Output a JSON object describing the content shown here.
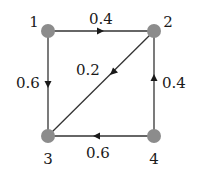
{
  "diagram": {
    "type": "directed-graph",
    "node_color": "#8c8c8c",
    "edge_color": "#333333",
    "nodes": [
      {
        "id": "1",
        "label": "1",
        "x": 48,
        "y": 31
      },
      {
        "id": "2",
        "label": "2",
        "x": 154,
        "y": 31
      },
      {
        "id": "3",
        "label": "3",
        "x": 48,
        "y": 136
      },
      {
        "id": "4",
        "label": "4",
        "x": 154,
        "y": 136
      }
    ],
    "edges": [
      {
        "from": "1",
        "to": "2",
        "weight": "0.4"
      },
      {
        "from": "1",
        "to": "3",
        "weight": "0.6"
      },
      {
        "from": "2",
        "to": "3",
        "weight": "0.2"
      },
      {
        "from": "4",
        "to": "2",
        "weight": "0.4"
      },
      {
        "from": "4",
        "to": "3",
        "weight": "0.6"
      }
    ]
  }
}
